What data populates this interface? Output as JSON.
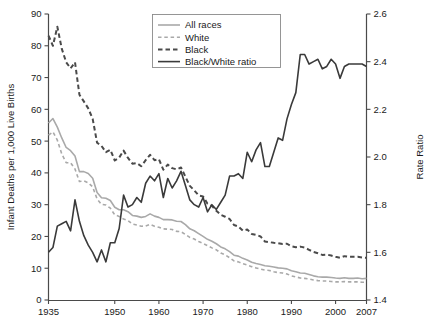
{
  "chart_data": {
    "type": "line",
    "title": "",
    "xlabel": "",
    "ylabel": "Infant Deaths per 1,000 Live Births",
    "y2label": "Rate Ratio",
    "xlim": [
      1935,
      2007
    ],
    "ylim": [
      0,
      90
    ],
    "y2lim": [
      1.4,
      2.6
    ],
    "xticks": [
      1935,
      1950,
      1960,
      1970,
      1980,
      1990,
      2000,
      2007
    ],
    "xticklabels": [
      "1935",
      "1950",
      "1960",
      "1970",
      "1980",
      "1990",
      "2000",
      "2007"
    ],
    "yticks": [
      0,
      10,
      20,
      30,
      40,
      50,
      60,
      70,
      80,
      90
    ],
    "yticklabels": [
      "0",
      "10",
      "20",
      "30",
      "40",
      "50",
      "60",
      "70",
      "80",
      "90"
    ],
    "y2ticks": [
      1.4,
      1.6,
      1.8,
      2.0,
      2.2,
      2.4,
      2.6
    ],
    "y2ticklabels": [
      "1.4",
      "1.6",
      "1.8",
      "2.0",
      "2.2",
      "2.4",
      "2.6"
    ],
    "grid": false,
    "legend_position": "top-center",
    "legend": [
      {
        "label": "All races",
        "style": "solid",
        "color": "#a9a9a9",
        "width": 1.6,
        "axis": "left"
      },
      {
        "label": "White",
        "style": "dashed",
        "color": "#a9a9a9",
        "width": 1.6,
        "axis": "left"
      },
      {
        "label": "Black",
        "style": "dashed",
        "color": "#4a4a4a",
        "width": 2.0,
        "axis": "left"
      },
      {
        "label": "Black/White ratio",
        "style": "solid",
        "color": "#3a3a3a",
        "width": 1.6,
        "axis": "right"
      }
    ],
    "x": [
      1935,
      1936,
      1937,
      1938,
      1939,
      1940,
      1941,
      1942,
      1943,
      1944,
      1945,
      1946,
      1947,
      1948,
      1949,
      1950,
      1951,
      1952,
      1953,
      1954,
      1955,
      1956,
      1957,
      1958,
      1959,
      1960,
      1961,
      1962,
      1963,
      1964,
      1965,
      1966,
      1967,
      1968,
      1969,
      1970,
      1971,
      1972,
      1973,
      1974,
      1975,
      1976,
      1977,
      1978,
      1979,
      1980,
      1981,
      1982,
      1983,
      1984,
      1985,
      1986,
      1987,
      1988,
      1989,
      1990,
      1991,
      1992,
      1993,
      1994,
      1995,
      1996,
      1997,
      1998,
      1999,
      2000,
      2001,
      2002,
      2003,
      2004,
      2005,
      2006,
      2007
    ],
    "series": [
      {
        "name": "All races",
        "axis": "left",
        "values": [
          55.7,
          57.1,
          54.4,
          51.0,
          48.0,
          47.0,
          45.3,
          40.4,
          40.4,
          39.8,
          38.3,
          33.8,
          32.2,
          32.0,
          31.3,
          29.2,
          28.4,
          28.4,
          27.8,
          26.6,
          26.4,
          26.0,
          26.3,
          27.1,
          26.4,
          26.0,
          25.3,
          25.3,
          25.2,
          24.8,
          24.7,
          23.7,
          22.4,
          21.8,
          20.9,
          20.0,
          19.1,
          18.5,
          17.7,
          16.7,
          16.1,
          15.2,
          14.1,
          13.8,
          13.1,
          12.6,
          11.9,
          11.5,
          11.2,
          10.8,
          10.6,
          10.4,
          10.1,
          10.0,
          9.8,
          9.2,
          8.9,
          8.5,
          8.4,
          8.0,
          7.6,
          7.3,
          7.2,
          7.2,
          7.1,
          6.9,
          6.8,
          7.0,
          6.8,
          6.8,
          6.9,
          6.7,
          6.8
        ]
      },
      {
        "name": "White",
        "axis": "left",
        "values": [
          51.9,
          52.9,
          50.3,
          46.0,
          43.2,
          43.2,
          41.2,
          37.3,
          37.5,
          36.9,
          35.6,
          31.8,
          30.1,
          29.9,
          28.9,
          26.8,
          26.3,
          25.5,
          25.0,
          23.9,
          23.6,
          23.2,
          23.3,
          23.8,
          23.2,
          22.9,
          22.4,
          22.3,
          22.2,
          21.6,
          21.5,
          20.6,
          19.7,
          19.2,
          18.4,
          17.8,
          17.1,
          16.4,
          15.8,
          14.8,
          14.2,
          13.3,
          12.3,
          12.0,
          11.4,
          11.0,
          10.5,
          10.1,
          9.7,
          9.4,
          9.3,
          8.9,
          8.6,
          8.5,
          8.2,
          7.6,
          7.3,
          6.9,
          6.8,
          6.6,
          6.3,
          6.1,
          6.0,
          6.0,
          5.8,
          5.7,
          5.7,
          5.8,
          5.7,
          5.7,
          5.7,
          5.6,
          5.6
        ]
      },
      {
        "name": "Black",
        "axis": "left",
        "values": [
          83.2,
          80.0,
          86.0,
          79.1,
          74.8,
          72.9,
          74.8,
          64.6,
          62.5,
          60.3,
          57.0,
          49.5,
          48.5,
          46.5,
          47.3,
          43.9,
          44.8,
          47.0,
          44.7,
          42.9,
          43.1,
          42.1,
          44.0,
          45.7,
          44.0,
          44.3,
          41.0,
          42.6,
          41.5,
          41.1,
          41.7,
          38.8,
          35.9,
          34.5,
          32.9,
          32.6,
          30.3,
          29.6,
          28.1,
          26.8,
          26.2,
          25.5,
          23.6,
          23.1,
          21.8,
          22.2,
          20.8,
          20.5,
          20.0,
          18.4,
          18.2,
          18.0,
          17.9,
          17.6,
          17.7,
          16.9,
          16.6,
          16.8,
          16.5,
          15.8,
          15.1,
          14.7,
          14.2,
          14.3,
          14.0,
          13.6,
          13.3,
          13.8,
          13.6,
          13.6,
          13.6,
          13.4,
          13.3
        ]
      },
      {
        "name": "Black/White ratio",
        "axis": "right",
        "values": [
          1.6,
          1.62,
          1.71,
          1.72,
          1.73,
          1.69,
          1.82,
          1.73,
          1.67,
          1.63,
          1.6,
          1.56,
          1.61,
          1.56,
          1.64,
          1.64,
          1.7,
          1.84,
          1.79,
          1.8,
          1.83,
          1.81,
          1.89,
          1.92,
          1.9,
          1.93,
          1.83,
          1.91,
          1.87,
          1.9,
          1.94,
          1.88,
          1.82,
          1.8,
          1.79,
          1.83,
          1.77,
          1.8,
          1.78,
          1.81,
          1.84,
          1.92,
          1.92,
          1.93,
          1.91,
          2.02,
          1.98,
          2.03,
          2.06,
          1.96,
          1.96,
          2.02,
          2.08,
          2.07,
          2.16,
          2.22,
          2.27,
          2.43,
          2.43,
          2.39,
          2.4,
          2.41,
          2.37,
          2.38,
          2.41,
          2.39,
          2.33,
          2.38,
          2.39,
          2.39,
          2.39,
          2.39,
          2.38
        ]
      }
    ]
  },
  "axes": {
    "left_title": "Infant Deaths per 1,000 Live Births",
    "right_title": "Rate Ratio"
  },
  "legend_items": [
    {
      "label": "All races"
    },
    {
      "label": "White"
    },
    {
      "label": "Black"
    },
    {
      "label": "Black/White ratio"
    }
  ]
}
